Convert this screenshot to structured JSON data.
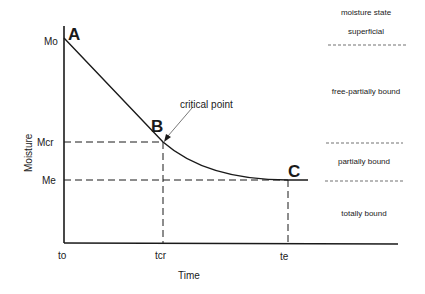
{
  "diagram": {
    "type": "drying-curve",
    "axes": {
      "x_label": "Time",
      "y_label": "Moisture",
      "x_ticks": [
        "to",
        "tcr",
        "te"
      ],
      "y_ticks": [
        "Mo",
        "Mcr",
        "Me"
      ]
    },
    "points": {
      "A": "A",
      "B": "B",
      "C": "C"
    },
    "annotation": "critical point",
    "moisture_states": {
      "header": "moisture state",
      "items": [
        "superficial",
        "free-partially bound",
        "partially bound",
        "totally bound"
      ]
    }
  }
}
